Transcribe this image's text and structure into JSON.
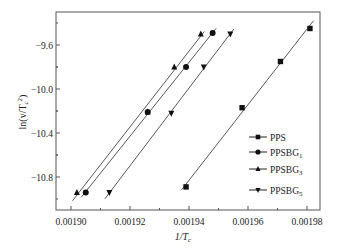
{
  "chart_data": {
    "type": "scatter",
    "title": "",
    "xlabel": "1/T_c",
    "ylabel": "ln(v/T_c^2)",
    "xlim": [
      0.001885,
      0.001985
    ],
    "ylim": [
      -11.03,
      -9.3
    ],
    "x_ticks": [
      0.0019,
      0.00192,
      0.00194,
      0.00196,
      0.00198
    ],
    "x_tick_labels": [
      "0.00190",
      "0.00192",
      "0.00194",
      "0.00196",
      "0.00198"
    ],
    "y_ticks": [
      -9.6,
      -10.0,
      -10.4,
      -10.8
    ],
    "y_tick_labels": [
      "-9.6",
      "-10.0",
      "-10.4",
      "-10.8"
    ],
    "grid": false,
    "legend_position": "lower right (inside)",
    "series": [
      {
        "name": "PPS",
        "marker": "square",
        "x": [
          0.001939,
          0.001958,
          0.001971,
          0.001981
        ],
        "y": [
          -10.89,
          -10.17,
          -9.75,
          -9.45
        ]
      },
      {
        "name": "PPSBG1",
        "marker": "circle",
        "x": [
          0.001905,
          0.001926,
          0.001939,
          0.001948
        ],
        "y": [
          -10.94,
          -10.21,
          -9.8,
          -9.49
        ]
      },
      {
        "name": "PPSBG3",
        "marker": "triangle-up",
        "x": [
          0.001902,
          0.001926,
          0.001935,
          0.001944
        ],
        "y": [
          -10.94,
          -10.21,
          -9.8,
          -9.5
        ]
      },
      {
        "name": "PPSBG5",
        "marker": "triangle-down",
        "x": [
          0.001913,
          0.001934,
          0.001945,
          0.001954
        ],
        "y": [
          -10.94,
          -10.22,
          -9.8,
          -9.5
        ]
      }
    ]
  },
  "axes": {
    "xlabel_main": "1/T",
    "xlabel_sub": "c",
    "ylabel_prefix": "ln(v/T",
    "ylabel_sub": "c",
    "ylabel_sup": "2",
    "ylabel_suffix": ")"
  },
  "legend": [
    {
      "main": "PPS",
      "sub": ""
    },
    {
      "main": "PPSBG",
      "sub": "1"
    },
    {
      "main": "PPSBG",
      "sub": "3"
    },
    {
      "main": "PPSBG",
      "sub": "5"
    }
  ]
}
